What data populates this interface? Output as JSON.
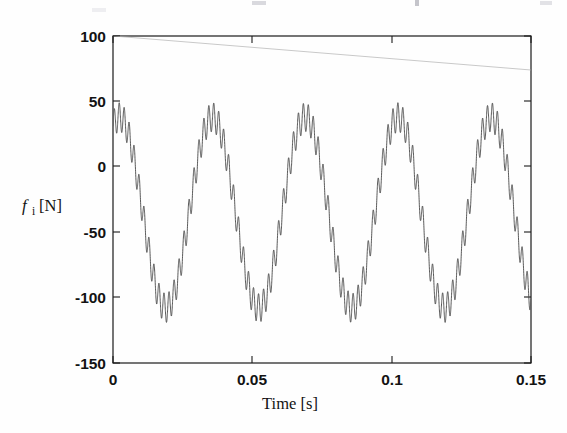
{
  "figure": {
    "background_color": "#fefefe",
    "axis_color": "#1a1a1a",
    "signal_color": "#3b3b3b",
    "envelope_color": "#c9c9c9"
  },
  "axes": {
    "y_title_symbol": "f",
    "y_title_subscript": "i",
    "y_title_unit": " [N]",
    "y_title_full": "f i [N]",
    "x_title": "Time [s]",
    "y_ticks": [
      "100",
      "50",
      "0",
      "-50",
      "-100",
      "-150"
    ],
    "x_ticks": [
      "0",
      "0.05",
      "0.1",
      "0.15"
    ]
  },
  "chart_data": {
    "type": "line",
    "title": "",
    "xlabel": "Time [s]",
    "ylabel": "f_i [N]",
    "xlim": [
      0,
      0.15
    ],
    "ylim": [
      -150,
      100
    ],
    "xticks": [
      0,
      0.05,
      0.1,
      0.15
    ],
    "yticks": [
      -150,
      -100,
      -50,
      0,
      50,
      100
    ],
    "grid": false,
    "legend": "none",
    "series": [
      {
        "name": "f_i force signal",
        "color": "#3b3b3b",
        "description": "30 Hz fundamental with superimposed ~560 Hz ripple, mean offset -35 N",
        "model": {
          "kind": "sine_plus_ripple",
          "offset": -35,
          "fundamental_amplitude": 73,
          "fundamental_frequency_hz": 30,
          "fundamental_phase_rad": 1.13,
          "ripple_amplitude": 11,
          "ripple_frequency_hz": 560,
          "ripple_phase_rad": 0
        },
        "sampled_points": [
          {
            "t": 0.0,
            "f": 33
          },
          {
            "t": 0.005,
            "f": -5
          },
          {
            "t": 0.01,
            "f": -55
          },
          {
            "t": 0.0167,
            "f": -108
          },
          {
            "t": 0.023,
            "f": -88
          },
          {
            "t": 0.03,
            "f": -20
          },
          {
            "t": 0.0355,
            "f": 39
          },
          {
            "t": 0.042,
            "f": 5
          },
          {
            "t": 0.048,
            "f": -60
          },
          {
            "t": 0.05,
            "f": -105
          },
          {
            "t": 0.0555,
            "f": -95
          },
          {
            "t": 0.062,
            "f": -25
          },
          {
            "t": 0.0688,
            "f": 38
          },
          {
            "t": 0.075,
            "f": 2
          },
          {
            "t": 0.082,
            "f": -62
          },
          {
            "t": 0.0855,
            "f": -108
          },
          {
            "t": 0.092,
            "f": -80
          },
          {
            "t": 0.098,
            "f": -14
          },
          {
            "t": 0.1022,
            "f": 41
          },
          {
            "t": 0.108,
            "f": 10
          },
          {
            "t": 0.115,
            "f": -55
          },
          {
            "t": 0.1195,
            "f": -107
          },
          {
            "t": 0.126,
            "f": -86
          },
          {
            "t": 0.132,
            "f": -18
          },
          {
            "t": 0.1372,
            "f": 41
          },
          {
            "t": 0.143,
            "f": 6
          },
          {
            "t": 0.148,
            "f": -60
          },
          {
            "t": 0.15,
            "f": -75
          }
        ]
      },
      {
        "name": "upper envelope reference",
        "color": "#c9c9c9",
        "description": "Faint slowly decaying straight reference line from 100 N to about 74 N",
        "points": [
          {
            "t": 0.0,
            "f": 100
          },
          {
            "t": 0.075,
            "f": 87
          },
          {
            "t": 0.15,
            "f": 74
          }
        ]
      }
    ]
  }
}
